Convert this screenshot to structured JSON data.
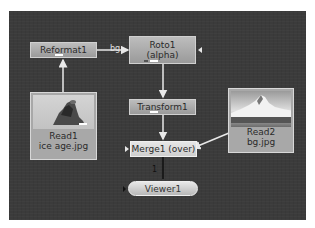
{
  "node_graph": {
    "background_color": "#3b3b3b",
    "nodes": [
      {
        "id": "reformat1",
        "label": "Reformat1"
      },
      {
        "id": "roto1",
        "label": "Roto1",
        "sublabel": "(alpha)"
      },
      {
        "id": "transform1",
        "label": "Transform1"
      },
      {
        "id": "read1",
        "label": "Read1",
        "sublabel": "ice age.jpg"
      },
      {
        "id": "read2",
        "label": "Read2",
        "sublabel": "bg.jpg"
      },
      {
        "id": "merge1",
        "label": "Merge1 (over)"
      },
      {
        "id": "viewer1",
        "label": "Viewer1"
      }
    ],
    "edges": [
      {
        "from": "read1",
        "to": "reformat1"
      },
      {
        "from": "reformat1",
        "to": "roto1",
        "label": "bg"
      },
      {
        "from": "roto1",
        "to": "transform1"
      },
      {
        "from": "transform1",
        "to": "merge1"
      },
      {
        "from": "read2",
        "to": "merge1"
      },
      {
        "from": "merge1",
        "to": "viewer1",
        "label": "1"
      }
    ],
    "edge_label_bg": "bg",
    "edge_label_viewer": "1"
  }
}
